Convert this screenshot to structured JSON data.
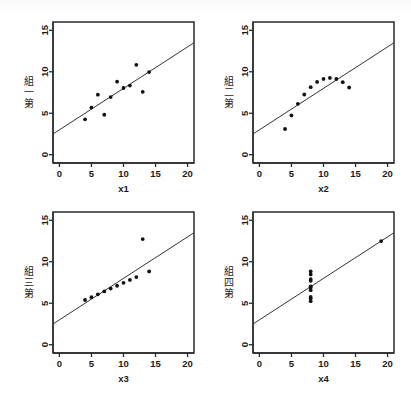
{
  "figure": {
    "kind": "anscombe-quartet-scatter-grid",
    "background_color": "#ffffff",
    "ink_color": "#1a1a1a",
    "point_color": "#111111",
    "line_color": "#333333",
    "frame_color": "#2b2b2b",
    "rows": 2,
    "cols": 2
  },
  "chart_data": [
    {
      "type": "scatter",
      "panel": 1,
      "title": "",
      "xlabel": "x1",
      "ylabel": "第一組",
      "xlim": [
        -1,
        21
      ],
      "ylim": [
        -1,
        16
      ],
      "xticks": [
        0,
        5,
        10,
        15,
        20
      ],
      "yticks": [
        0,
        5,
        10,
        15
      ],
      "xticklabels": [
        "0",
        "5",
        "10",
        "15",
        "20"
      ],
      "yticklabels": [
        "0",
        "5",
        "10",
        "15"
      ],
      "grid": false,
      "legend": "none",
      "x": [
        10.0,
        8.0,
        13.0,
        9.0,
        11.0,
        14.0,
        6.0,
        4.0,
        12.0,
        7.0,
        5.0
      ],
      "y": [
        8.04,
        6.95,
        7.58,
        8.81,
        8.33,
        9.96,
        7.24,
        4.26,
        10.84,
        4.82,
        5.68
      ],
      "fit_line": {
        "slope": 0.5,
        "intercept": 3.0,
        "x_start": -1,
        "x_end": 21
      }
    },
    {
      "type": "scatter",
      "panel": 2,
      "title": "",
      "xlabel": "x2",
      "ylabel": "第二組",
      "xlim": [
        -1,
        21
      ],
      "ylim": [
        -1,
        16
      ],
      "xticks": [
        0,
        5,
        10,
        15,
        20
      ],
      "yticks": [
        0,
        5,
        10,
        15
      ],
      "xticklabels": [
        "0",
        "5",
        "10",
        "15",
        "20"
      ],
      "yticklabels": [
        "0",
        "5",
        "10",
        "15"
      ],
      "grid": false,
      "legend": "none",
      "x": [
        10.0,
        8.0,
        13.0,
        9.0,
        11.0,
        14.0,
        6.0,
        4.0,
        12.0,
        7.0,
        5.0
      ],
      "y": [
        9.14,
        8.14,
        8.74,
        8.77,
        9.26,
        8.1,
        6.13,
        3.1,
        9.13,
        7.26,
        4.74
      ],
      "fit_line": {
        "slope": 0.5,
        "intercept": 3.0,
        "x_start": -1,
        "x_end": 21
      }
    },
    {
      "type": "scatter",
      "panel": 3,
      "title": "",
      "xlabel": "x3",
      "ylabel": "第三組",
      "xlim": [
        -1,
        21
      ],
      "ylim": [
        -1,
        16
      ],
      "xticks": [
        0,
        5,
        10,
        15,
        20
      ],
      "yticks": [
        0,
        5,
        10,
        15
      ],
      "xticklabels": [
        "0",
        "5",
        "10",
        "15",
        "20"
      ],
      "yticklabels": [
        "0",
        "5",
        "10",
        "15"
      ],
      "grid": false,
      "legend": "none",
      "x": [
        10.0,
        8.0,
        13.0,
        9.0,
        11.0,
        14.0,
        6.0,
        4.0,
        12.0,
        7.0,
        5.0
      ],
      "y": [
        7.46,
        6.77,
        12.74,
        7.11,
        7.81,
        8.84,
        6.08,
        5.39,
        8.15,
        6.42,
        5.73
      ],
      "fit_line": {
        "slope": 0.5,
        "intercept": 3.0,
        "x_start": -1,
        "x_end": 21
      }
    },
    {
      "type": "scatter",
      "panel": 4,
      "title": "",
      "xlabel": "x4",
      "ylabel": "第四組",
      "xlim": [
        -1,
        21
      ],
      "ylim": [
        -1,
        16
      ],
      "xticks": [
        0,
        5,
        10,
        15,
        20
      ],
      "yticks": [
        0,
        5,
        10,
        15
      ],
      "xticklabels": [
        "0",
        "5",
        "10",
        "15",
        "20"
      ],
      "yticklabels": [
        "0",
        "5",
        "10",
        "15"
      ],
      "grid": false,
      "legend": "none",
      "x": [
        8.0,
        8.0,
        8.0,
        8.0,
        8.0,
        8.0,
        8.0,
        19.0,
        8.0,
        8.0,
        8.0
      ],
      "y": [
        6.58,
        5.76,
        7.71,
        8.84,
        8.47,
        7.04,
        5.25,
        12.5,
        5.56,
        7.91,
        6.89
      ],
      "fit_line": {
        "slope": 0.5,
        "intercept": 3.0,
        "x_start": -1,
        "x_end": 21
      }
    }
  ]
}
